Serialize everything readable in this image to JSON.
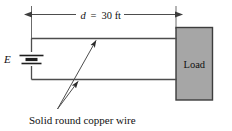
{
  "figure": {
    "background_color": "#ffffff",
    "line_color": "#4d4d4d",
    "text_color": "#111111"
  },
  "dimension": {
    "symbol": "d",
    "equals": "=",
    "value": "30 ft",
    "full_label": "d  =  30 ft"
  },
  "source": {
    "label": "E",
    "type": "battery"
  },
  "load": {
    "label": "Load",
    "fill_color": "#a6a6a6",
    "border_color": "#3d3d3d"
  },
  "caption": {
    "text": "Solid round copper wire"
  },
  "conductors": {
    "top_label": "top conductor",
    "bottom_label": "bottom conductor"
  }
}
